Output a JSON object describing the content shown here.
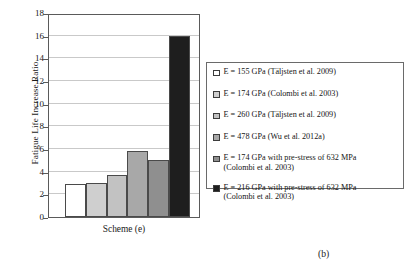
{
  "chart_data": {
    "type": "bar",
    "title": "",
    "subtitle": "",
    "xlabel": "Scheme (e)",
    "ylabel": "Fatigue Life Increase Ratio",
    "ylim": [
      0,
      18
    ],
    "ytick_step": 2,
    "yticks": [
      "18",
      "16",
      "14",
      "12",
      "10",
      "8",
      "6",
      "4",
      "2",
      "0"
    ],
    "grid": true,
    "legend_position": "right-outside",
    "categories": [
      "E = 155 GPa (Täljsten et al. 2009)",
      "E = 174 GPa (Colombi et al. 2003)",
      "E = 260 GPa (Täljsten et al. 2009)",
      "E = 478 GPa (Wu et al. 2012a)",
      "E = 174 GPa with pre-stress of 632 MPa (Colombi et al. 2003)",
      "E = 216 GPa with pre-stress of 632 MPa (Colombi et al. 2003)"
    ],
    "values": [
      2.9,
      3.0,
      3.7,
      5.8,
      5.0,
      16.0
    ],
    "colors": [
      "#ffffff",
      "#cfcfcf",
      "#c2c2c2",
      "#a8a8a8",
      "#8f8f8f",
      "#1e1e1e"
    ]
  },
  "legend": {
    "items": [
      {
        "label": "E = 155 GPa (Täljsten et al. 2009)",
        "swatch": "#ffffff"
      },
      {
        "label": "E = 174 GPa (Colombi et al. 2003)",
        "swatch": "#cfcfcf"
      },
      {
        "label": "E = 260 GPa (Täljsten et al. 2009)",
        "swatch": "#c2c2c2"
      },
      {
        "label": "E = 478 GPa (Wu et al. 2012a)",
        "swatch": "#a8a8a8"
      },
      {
        "label": "E = 174 GPa with pre-stress of 632 MPa\n(Colombi et al. 2003)",
        "swatch": "#8f8f8f"
      },
      {
        "label": "E = 216 GPa with pre-stress of 632 MPa\n(Colombi et al. 2003)",
        "swatch": "#1e1e1e"
      }
    ]
  },
  "caption": {
    "subfigure": "(b)"
  }
}
